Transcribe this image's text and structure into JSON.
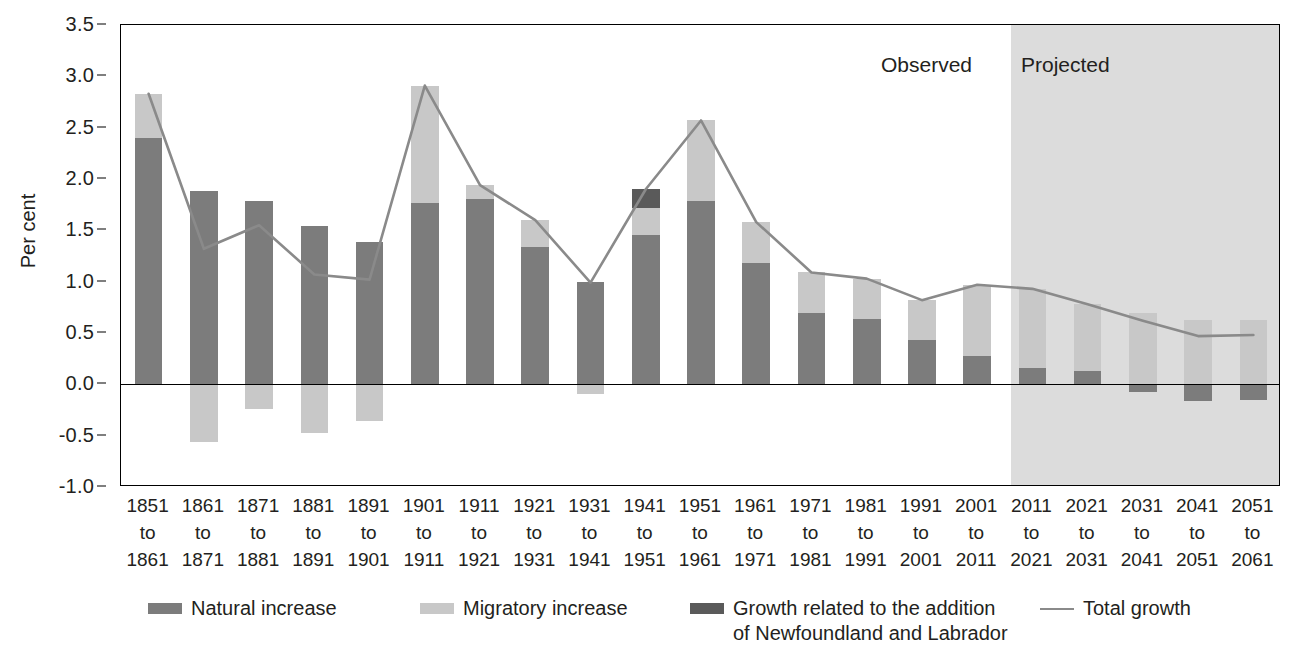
{
  "chart_data": {
    "type": "bar",
    "title": "",
    "xlabel": "",
    "ylabel": "Per cent",
    "ylim": [
      -1.0,
      3.5
    ],
    "yticks": [
      "3.5",
      "3.0",
      "2.5",
      "2.0",
      "1.5",
      "1.0",
      "0.5",
      "0.0",
      "-0.5",
      "-1.0"
    ],
    "ytick_values": [
      3.5,
      3.0,
      2.5,
      2.0,
      1.5,
      1.0,
      0.5,
      0.0,
      -0.5,
      -1.0
    ],
    "grid": false,
    "stacked": true,
    "legend_position": "bottom",
    "categories": [
      "1851\nto\n1861",
      "1861\nto\n1871",
      "1871\nto\n1881",
      "1881\nto\n1891",
      "1891\nto\n1901",
      "1901\nto\n1911",
      "1911\nto\n1921",
      "1921\nto\n1931",
      "1931\nto\n1941",
      "1941\nto\n1951",
      "1951\nto\n1961",
      "1961\nto\n1971",
      "1971\nto\n1981",
      "1981\nto\n1991",
      "1991\nto\n2001",
      "2001\nto\n2011",
      "2011\nto\n2021",
      "2021\nto\n2031",
      "2031\nto\n2041",
      "2041\nto\n2051",
      "2051\nto\n2061"
    ],
    "series": [
      {
        "name": "Natural increase",
        "color": "#7c7c7c",
        "values": [
          2.4,
          1.88,
          1.79,
          1.54,
          1.39,
          1.77,
          1.81,
          1.34,
          1.0,
          1.45,
          1.79,
          1.18,
          0.69,
          0.64,
          0.43,
          0.28,
          0.16,
          0.13,
          -0.07,
          -0.16,
          -0.15
        ]
      },
      {
        "name": "Migratory increase",
        "color": "#c8c8c8",
        "values": [
          0.43,
          -0.56,
          -0.24,
          -0.47,
          -0.36,
          1.14,
          0.13,
          0.26,
          -0.09,
          0.27,
          0.78,
          0.4,
          0.4,
          0.39,
          0.39,
          0.69,
          0.77,
          0.65,
          0.69,
          0.63,
          0.63
        ]
      },
      {
        "name": "Growth related to the addition\nof Newfoundland and Labrador",
        "color": "#5a5a5a",
        "values": [
          0,
          0,
          0,
          0,
          0,
          0,
          0,
          0,
          0,
          0.18,
          0,
          0,
          0,
          0,
          0,
          0,
          0,
          0,
          0,
          0,
          0
        ]
      }
    ],
    "line_series": {
      "name": "Total growth",
      "color": "#8a8a8a",
      "values": [
        2.83,
        1.32,
        1.55,
        1.07,
        1.02,
        2.91,
        1.94,
        1.6,
        0.99,
        1.9,
        2.57,
        1.58,
        1.09,
        1.03,
        0.82,
        0.97,
        0.93,
        0.78,
        0.62,
        0.47,
        0.48
      ]
    },
    "annotations": [
      {
        "text": "Observed",
        "x_category_index": 15
      },
      {
        "text": "Projected",
        "x_category_index": 16
      }
    ],
    "regions": [
      {
        "label": "Observed",
        "from_category": "1851\nto\n1861",
        "to_category": "2001\nto\n2011",
        "shaded": false
      },
      {
        "label": "Projected",
        "from_category": "2011\nto\n2021",
        "to_category": "2051\nto\n2061",
        "shaded": true,
        "shade_color": "#dcdcdc"
      }
    ]
  },
  "axis": {
    "y_title": "Per cent"
  },
  "panels": {
    "observed": "Observed",
    "projected": "Projected"
  },
  "legend": {
    "items": [
      {
        "label": "Natural increase",
        "type": "swatch",
        "color": "#7c7c7c"
      },
      {
        "label": "Migratory increase",
        "type": "swatch",
        "color": "#c8c8c8"
      },
      {
        "label": "Growth related to the addition\nof Newfoundland and Labrador",
        "type": "swatch",
        "color": "#5a5a5a"
      },
      {
        "label": "Total growth",
        "type": "line",
        "color": "#8a8a8a"
      }
    ]
  }
}
